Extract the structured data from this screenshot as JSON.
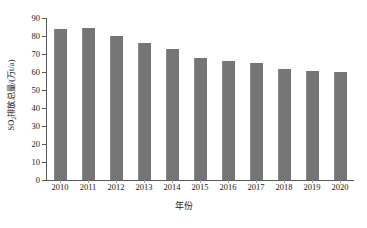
{
  "chart_data": {
    "type": "bar",
    "title": "",
    "xlabel": "年份",
    "ylabel": "SO2排放总量/(万t/a)",
    "ylabel_prefix": "SO",
    "ylabel_sub": "2",
    "ylabel_suffix": "排放总量/(万t/a)",
    "categories": [
      "2010",
      "2011",
      "2012",
      "2013",
      "2014",
      "2015",
      "2016",
      "2017",
      "2018",
      "2019",
      "2020"
    ],
    "values": [
      83.7,
      84.7,
      79.9,
      76.2,
      73.0,
      67.7,
      66.3,
      65.2,
      61.6,
      60.8,
      60.0
    ],
    "series": [
      {
        "name": "SO2排放总量",
        "values": [
          83.7,
          84.7,
          79.9,
          76.2,
          73.0,
          67.7,
          66.3,
          65.2,
          61.6,
          60.8,
          60.0
        ]
      }
    ],
    "ylim": [
      0,
      90
    ],
    "yticks": [
      0,
      10,
      20,
      30,
      40,
      50,
      60,
      70,
      80,
      90
    ],
    "ytick_labels": [
      "0",
      "10",
      "20",
      "30",
      "40",
      "50",
      "60",
      "70",
      "80",
      "90"
    ],
    "grid": false,
    "legend": null,
    "legend_position": "none",
    "bar_color": "#757577",
    "axis_color": "#58585a",
    "text_color": "#1a1a1a",
    "background_color": "#ffffff"
  }
}
